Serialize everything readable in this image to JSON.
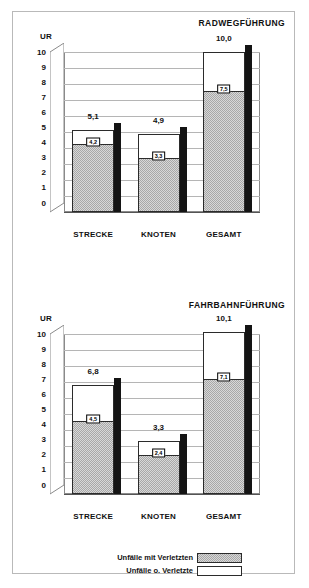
{
  "chart_data": [
    {
      "type": "bar",
      "title": "RADWEGFÜHRUNG",
      "xlabel": "",
      "ylabel": "UR",
      "ylim": [
        0,
        10
      ],
      "yticks": [
        "0",
        "1",
        "2",
        "3",
        "4",
        "5",
        "6",
        "7",
        "8",
        "9",
        "10"
      ],
      "categories": [
        "STRECKE",
        "KNOTEN",
        "GESAMT"
      ],
      "stacked": true,
      "grid": true,
      "legend_position": "bottom",
      "series": [
        {
          "name": "Unfälle mit Verletzten",
          "color": "#a8a8a8",
          "values": [
            4.2,
            3.3,
            7.5
          ],
          "labels": [
            "4,2",
            "3,3",
            "7,5"
          ]
        },
        {
          "name": "Unfälle o. Verletzte",
          "color": "#ffffff",
          "values": [
            0.9,
            1.6,
            2.5
          ],
          "labels": [
            "",
            "",
            ""
          ]
        }
      ],
      "totals": [
        5.1,
        4.9,
        10.0
      ],
      "total_labels": [
        "5,1",
        "4,9",
        "10,0"
      ]
    },
    {
      "type": "bar",
      "title": "FAHRBAHNFÜHRUNG",
      "xlabel": "",
      "ylabel": "UR",
      "ylim": [
        0,
        10
      ],
      "yticks": [
        "0",
        "1",
        "2",
        "3",
        "4",
        "5",
        "6",
        "7",
        "8",
        "9",
        "10"
      ],
      "categories": [
        "STRECKE",
        "KNOTEN",
        "GESAMT"
      ],
      "stacked": true,
      "grid": true,
      "legend_position": "bottom",
      "series": [
        {
          "name": "Unfälle mit Verletzten",
          "color": "#a8a8a8",
          "values": [
            4.5,
            2.4,
            7.1
          ],
          "labels": [
            "4,5",
            "2,4",
            "7,1"
          ]
        },
        {
          "name": "Unfälle o. Verletzte",
          "color": "#ffffff",
          "values": [
            2.3,
            0.9,
            3.0
          ],
          "labels": [
            "",
            "",
            ""
          ]
        }
      ],
      "totals": [
        6.8,
        3.3,
        10.1
      ],
      "total_labels": [
        "6,8",
        "3,3",
        "10,1"
      ]
    }
  ],
  "charts": {
    "radweg": {
      "title": "RADWEGFÜHRUNG",
      "axis_title": "UR",
      "yticks": [
        "10",
        "9",
        "8",
        "7",
        "6",
        "5",
        "4",
        "3",
        "2",
        "1",
        "0"
      ],
      "bars": [
        {
          "category": "STRECKE",
          "total_label": "5,1",
          "inner_label": "4,2"
        },
        {
          "category": "KNOTEN",
          "total_label": "4,9",
          "inner_label": "3,3"
        },
        {
          "category": "GESAMT",
          "total_label": "10,0",
          "inner_label": "7,5"
        }
      ]
    },
    "fahrbahn": {
      "title": "FAHRBAHNFÜHRUNG",
      "axis_title": "UR",
      "yticks": [
        "10",
        "9",
        "8",
        "7",
        "6",
        "5",
        "4",
        "3",
        "2",
        "1",
        "0"
      ],
      "bars": [
        {
          "category": "STRECKE",
          "total_label": "6,8",
          "inner_label": "4,5"
        },
        {
          "category": "KNOTEN",
          "total_label": "3,3",
          "inner_label": "2,4"
        },
        {
          "category": "GESAMT",
          "total_label": "10,1",
          "inner_label": "7,1"
        }
      ]
    }
  },
  "legend": {
    "items": [
      {
        "label": "Unfälle mit Verletzten",
        "swatch": "gray"
      },
      {
        "label": "Unfälle o. Verletzte",
        "swatch": "white"
      }
    ]
  }
}
